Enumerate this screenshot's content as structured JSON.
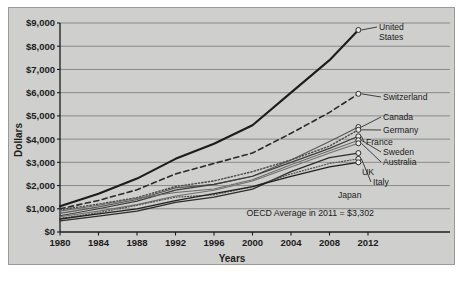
{
  "chart_data": {
    "type": "line",
    "title": "",
    "xlabel": "Years",
    "ylabel": "Dollars",
    "xlim": [
      1980,
      2012
    ],
    "ylim": [
      0,
      9000
    ],
    "grid": true,
    "legend_position": "inline-right-labels",
    "x_ticks": [
      "1980",
      "1984",
      "1988",
      "1992",
      "1996",
      "2000",
      "2004",
      "2008",
      "2012"
    ],
    "x_tick_values": [
      1980,
      1984,
      1988,
      1992,
      1996,
      2000,
      2004,
      2008,
      2012
    ],
    "y_ticks": [
      "$0",
      "$1,000",
      "$2,000",
      "$3,000",
      "$4,000",
      "$5,000",
      "$6,000",
      "$7,000",
      "$8,000",
      "$9,000"
    ],
    "y_tick_values": [
      0,
      1000,
      2000,
      3000,
      4000,
      5000,
      6000,
      7000,
      8000,
      9000
    ],
    "annotations": [
      {
        "text": "OECD Average in 2011 = $3,302",
        "x": 2006,
        "y": 700
      }
    ],
    "x": [
      1980,
      1984,
      1988,
      1992,
      1996,
      2000,
      2004,
      2008,
      2011
    ],
    "series": [
      {
        "name": "United States",
        "label": "United States",
        "style": "solid",
        "color": "#1c1c1c",
        "width": 2.1,
        "values": [
          1110,
          1650,
          2300,
          3150,
          3800,
          4600,
          6000,
          7400,
          8700
        ]
      },
      {
        "name": "Switzerland",
        "label": "Switzerland",
        "style": "dashed",
        "color": "#2a2a2a",
        "width": 1.6,
        "values": [
          1000,
          1360,
          1820,
          2500,
          2950,
          3400,
          4250,
          5150,
          5950
        ]
      },
      {
        "name": "Canada",
        "label": "Canada",
        "style": "solid",
        "color": "#5a5a5a",
        "width": 1.2,
        "values": [
          800,
          1080,
          1400,
          1900,
          2050,
          2400,
          3100,
          3900,
          4520
        ]
      },
      {
        "name": "Germany",
        "label": "Germany",
        "style": "dotted",
        "color": "#4a4a4a",
        "width": 1.4,
        "values": [
          960,
          1200,
          1480,
          1960,
          2200,
          2600,
          3100,
          3700,
          4400
        ]
      },
      {
        "name": "France",
        "label": "France",
        "style": "solid",
        "color": "#3c3c3c",
        "width": 1.2,
        "values": [
          700,
          1000,
          1330,
          1800,
          2050,
          2400,
          3000,
          3600,
          4120
        ]
      },
      {
        "name": "Sweden",
        "label": "Sweden",
        "style": "solid",
        "color": "#6a6a6a",
        "width": 1.1,
        "values": [
          900,
          1150,
          1450,
          1700,
          1850,
          2250,
          2900,
          3500,
          3950
        ]
      },
      {
        "name": "Australia",
        "label": "Australia",
        "style": "solid",
        "color": "#707070",
        "width": 1.1,
        "values": [
          660,
          900,
          1180,
          1550,
          1800,
          2200,
          2800,
          3400,
          3820
        ]
      },
      {
        "name": "UK",
        "label": "UK",
        "style": "solid",
        "color": "#2c2c2c",
        "width": 1.3,
        "values": [
          480,
          680,
          900,
          1280,
          1500,
          1850,
          2600,
          3200,
          3400
        ]
      },
      {
        "name": "Italy",
        "label": "Italy",
        "style": "dotted",
        "color": "#555555",
        "width": 1.2,
        "values": [
          580,
          830,
          1150,
          1500,
          1600,
          1950,
          2500,
          2950,
          3150
        ]
      },
      {
        "name": "Japan",
        "label": "Japan",
        "style": "solid",
        "color": "#1f1f1f",
        "width": 1.3,
        "values": [
          560,
          780,
          1000,
          1350,
          1650,
          1950,
          2400,
          2800,
          3000
        ]
      }
    ],
    "series_end_labels": [
      {
        "name": "United States",
        "label_line1": "United",
        "label_line2": "States"
      },
      {
        "name": "Switzerland",
        "label_line1": "Switzerland",
        "label_line2": ""
      },
      {
        "name": "Canada",
        "label_line1": "Canada",
        "label_line2": ""
      },
      {
        "name": "Germany",
        "label_line1": "Germany",
        "label_line2": ""
      },
      {
        "name": "France",
        "label_line1": "France",
        "label_line2": ""
      },
      {
        "name": "Sweden",
        "label_line1": "Sweden",
        "label_line2": ""
      },
      {
        "name": "Australia",
        "label_line1": "Australia",
        "label_line2": ""
      },
      {
        "name": "UK",
        "label_line1": "UK",
        "label_line2": ""
      },
      {
        "name": "Italy",
        "label_line1": "Italy",
        "label_line2": ""
      },
      {
        "name": "Japan",
        "label_line1": "Japan",
        "label_line2": ""
      }
    ]
  },
  "colors": {
    "panel_background": "#cfcfcd",
    "page_background": "#ffffff",
    "gridline": "#77777a",
    "axis": "#1c1c1c",
    "text": "#1c1c1c"
  }
}
